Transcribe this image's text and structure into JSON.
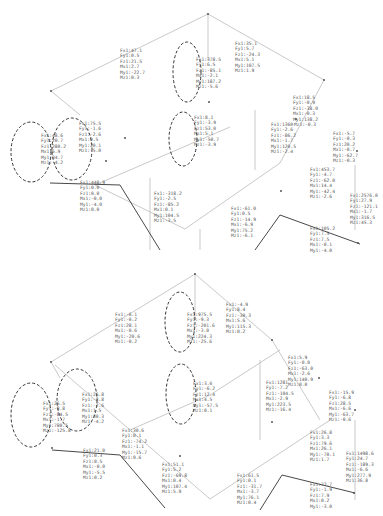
{
  "panels": [
    {
      "name": "top",
      "labels": [
        {
          "id": "t1",
          "lines": [
            "Fx1:47.1",
            "Fy1:0.5",
            "Fz1:21.5",
            "Mx1:2.7",
            "My1:-22.7",
            "Mz1:0.3"
          ]
        },
        {
          "id": "t2",
          "lines": [
            "Fx1:378.5",
            "Fy1:6.5",
            "Fz1:-85.1",
            "Mx1:-2.1",
            "My1:187.2",
            "Mz1:-5.6"
          ]
        },
        {
          "id": "t3",
          "lines": [
            "Fx1:35.1",
            "Fy1:5.7",
            "Fz1:-24.3",
            "Mx1:5.1",
            "My1:107.5",
            "Mz1:1.9"
          ]
        },
        {
          "id": "t4",
          "lines": [
            "Fx1:75.5",
            "Fy1:-1.6",
            "Fz1:-2.6",
            "Mx1:0.5",
            "My1:20.1",
            "Mz1:-5.0"
          ]
        },
        {
          "id": "t5",
          "lines": [
            "Fx1:48.6",
            "Fy1:20.7",
            "Fz1:280.2",
            "Mx1:6.9",
            "My1:34.7",
            "Mz1:-4.2"
          ]
        },
        {
          "id": "t6",
          "lines": [
            "Fx1:8.1",
            "Fy1:-3.9",
            "Fz1:53.0",
            "Mx1:5.1",
            "My1:-50.7",
            "Mz1:-3.9"
          ]
        },
        {
          "id": "t7",
          "lines": [
            "Fx1:18.5",
            "Fy1:-0.9",
            "Fz1:-38.0",
            "Mx1:-0.3",
            "My1:138.2"
          ]
        },
        {
          "id": "t8",
          "lines": [
            "Fx1:1360",
            "Fy1:-2.6",
            "Fz1:-86.2",
            "Mx1:-1.7",
            "My1:120.5",
            "Mz1:-2.4"
          ]
        },
        {
          "id": "t8b",
          "lines": [
            "Mz1:-0.3"
          ]
        },
        {
          "id": "t9",
          "lines": [
            "Fx1:-5.7",
            "Fy1:-0.3",
            "Fz1:20.2",
            "Mx1:-0.7",
            "My1:-62.7",
            "Mz1:-0.3"
          ]
        },
        {
          "id": "t10",
          "lines": [
            "Fx1:440.9",
            "Fy1:0.0",
            "Fz1:0.0",
            "Mx1:-0.0",
            "My1:-4.0",
            "Mz1:0.0"
          ]
        },
        {
          "id": "t11",
          "lines": [
            "Fx1:-318.2",
            "Fy1:-2.5",
            "Fz1:-85.2",
            "Mx1:0.1",
            "My1:104.5",
            "Mz1:-3.5"
          ]
        },
        {
          "id": "t12",
          "lines": [
            "Fx1:453.7",
            "Fy1:-4.7",
            "Fz1:-62.0",
            "Mx1:14.4",
            "My1:-42.4",
            "Mz1:-2.6"
          ]
        },
        {
          "id": "t13",
          "lines": [
            "Fx1:-61.0",
            "Fy1:0.5",
            "Fz1:-14.9",
            "Mx1:-6.9",
            "My1:75.2",
            "Mz1:-6.1"
          ]
        },
        {
          "id": "t14",
          "lines": [
            "Fx1:2576.0",
            "Fy1:27.9",
            "Fz1:-121.1",
            "Mx1:-1.7",
            "My1:316.5",
            "Mz1:45.3"
          ]
        },
        {
          "id": "t15",
          "lines": [
            "Fx1:105.2",
            "Fy1:7.5",
            "Fz1:7.5",
            "Mx1:-0.1",
            "My1:-4.0"
          ]
        }
      ]
    },
    {
      "name": "bottom",
      "labels": [
        {
          "id": "b1",
          "lines": [
            "Fx1:-6.1",
            "Fy1:-0.2",
            "Fz1:28.1",
            "Mx1:-0.6",
            "My1:-20.6",
            "Mz1:-0.2"
          ]
        },
        {
          "id": "b2",
          "lines": [
            "Fx1:975.5",
            "Fy1:-9.3",
            "Fz1:-201.6",
            "Mx1:-3.0",
            "My1:224.3",
            "Mz1:-25.6"
          ]
        },
        {
          "id": "b3",
          "lines": [
            "Fx1:-4.9",
            "Fy1:8.4",
            "Fz1:-30.3",
            "Mx1:5.6",
            "My1:115.3",
            "Mz1:0.2"
          ]
        },
        {
          "id": "b4",
          "lines": [
            "Fx1:26.8",
            "Fy1:-3.8",
            "Fz1:-2.6",
            "Mx1:1.5",
            "My1:30.3",
            "Mz1:-4.2"
          ]
        },
        {
          "id": "b5",
          "lines": [
            "Fx1:26.5",
            "Fy1:-8.8",
            "Fz1:-84.5",
            "Mx1:-1.7",
            "My1:780.5",
            "Mz1:-125.8"
          ]
        },
        {
          "id": "b6",
          "lines": [
            "Fx1:3.6",
            "Fy1:-6.2",
            "Fz1:12.4",
            "Mx1:4.5",
            "My1:-57.5",
            "Mz1:0.1"
          ]
        },
        {
          "id": "b7",
          "lines": [
            "Fx1:5.9",
            "Fy1:-0.0",
            "Fz1:-63.0",
            "Mx1:-2.6",
            "My1:140.9",
            "Mz1:0.0"
          ]
        },
        {
          "id": "b8",
          "lines": [
            "Fx1:1281",
            "Fy1:-7.2",
            "Fz1:-104.5",
            "Mx1:-2.9",
            "My1:223.5",
            "Mz1:-16.4"
          ]
        },
        {
          "id": "b9",
          "lines": [
            "Fx1:-15.9",
            "Fy1:-6.8",
            "Fz1:28.5",
            "Mx1:-6.6",
            "My1:-63.7",
            "Mz1:-0.6"
          ]
        },
        {
          "id": "b10",
          "lines": [
            "Fx1:30.6",
            "Fy1:0.1",
            "Fz1:-74.2",
            "Mx1:-1.1",
            "My1:-15.7",
            "Mz1:0.6"
          ]
        },
        {
          "id": "b11",
          "lines": [
            "Fx1:21.0",
            "Fy1:0.3",
            "Fz1:0.5",
            "Mx1:-0.0",
            "My1:-5.5",
            "Mz1:0.2"
          ]
        },
        {
          "id": "b12",
          "lines": [
            "Fx1:51.1",
            "Fy1:5.2",
            "Fz1:-69.8",
            "Mx1:0.4",
            "My1:107.4",
            "Mz1:5.9"
          ]
        },
        {
          "id": "b13",
          "lines": [
            "Fx1:26.8",
            "Fy1:3.3",
            "Fz1:79.6",
            "Mx1:26.1",
            "My1:-70.1",
            "Mz1:1.7"
          ]
        },
        {
          "id": "b14",
          "lines": [
            "Fx1:61.5",
            "Fy1:0.1",
            "Fz1:-31.7",
            "Mx1:-3.7",
            "My1:76.1",
            "Mz1:0.4"
          ]
        },
        {
          "id": "b15",
          "lines": [
            "Fx1:1498.6",
            "Fy1:24.7",
            "Fz1:-189.3",
            "Mx1:-6.6",
            "My1:277.9",
            "Mz1:36.8"
          ]
        },
        {
          "id": "b16",
          "lines": [
            "Fx1:72.7",
            "Fy1:-1.9",
            "Fz1:7.9",
            "Mx1:0.2",
            "My1:-3.0"
          ]
        }
      ]
    }
  ]
}
